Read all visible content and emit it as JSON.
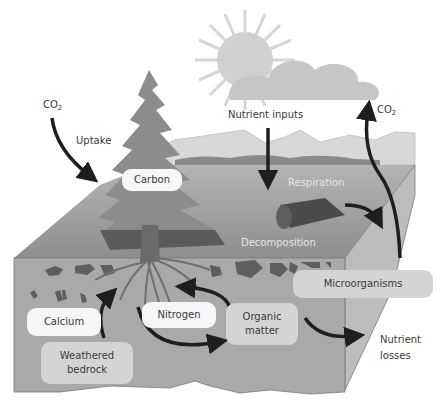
{
  "diagram": {
    "labels": {
      "co2_left": "CO",
      "co2_left_sub": "2",
      "uptake": "Uptake",
      "nutrient_inputs": "Nutrient inputs",
      "co2_right": "CO",
      "co2_right_sub": "2",
      "respiration": "Respiration",
      "decomposition": "Decomposition",
      "nutrient_losses_line1": "Nutrient",
      "nutrient_losses_line2": "losses"
    },
    "boxes": {
      "carbon": "Carbon",
      "calcium": "Calcium",
      "nitrogen": "Nitrogen",
      "organic_matter_line1": "Organic",
      "organic_matter_line2": "matter",
      "weathered_bedrock_line1": "Weathered",
      "weathered_bedrock_line2": "bedrock",
      "microorganisms": "Microorganisms"
    },
    "colors": {
      "soil_front": "#a9a9a9",
      "soil_side": "#bdbdbd",
      "ground_top": "#9a9a9a",
      "tree": "#6e6e6e",
      "arrow": "#1e1e1e",
      "sun": "#d0d0d0",
      "cloud": "#c4c4c4"
    }
  }
}
